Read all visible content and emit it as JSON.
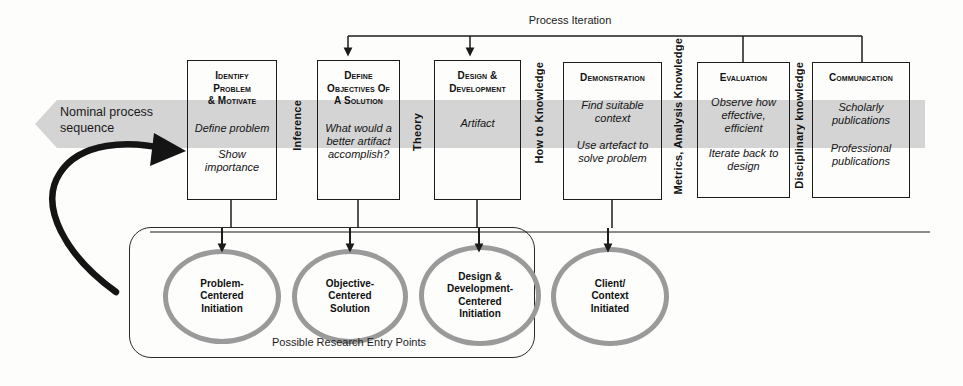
{
  "diagram": {
    "nominal_band_label": "Nominal process\nsequence",
    "process_iteration_label": "Process Iteration",
    "entry_points_caption": "Possible Research Entry Points",
    "accent_grey": "#d4d4d4",
    "circle_stroke": "#9a9a9a",
    "line_color": "#1b1b1b"
  },
  "boxes": [
    {
      "id": "identify-problem",
      "title": "Identify\nProblem\n& Motivate",
      "lines": [
        "Define problem",
        "Show\nimportance"
      ]
    },
    {
      "id": "define-objectives",
      "title": "Define\nObjectives of\na Solution",
      "lines": [
        "What would a\nbetter artifact\naccomplish?"
      ]
    },
    {
      "id": "design-development",
      "title": "Design &\nDevelopment",
      "lines": [
        "Artifact"
      ]
    },
    {
      "id": "demonstration",
      "title": "Demonstration",
      "lines": [
        "Find suitable\ncontext",
        "Use artefact to\nsolve problem"
      ]
    },
    {
      "id": "evaluation",
      "title": "Evaluation",
      "lines": [
        "Observe how\neffective,\nefficient",
        "Iterate back to\ndesign"
      ]
    },
    {
      "id": "communication",
      "title": "Communication",
      "lines": [
        "Scholarly\npublications",
        "Professional\npublications"
      ]
    }
  ],
  "knowledge_labels": [
    {
      "id": "inference",
      "text": "Inference"
    },
    {
      "id": "theory",
      "text": "Theory"
    },
    {
      "id": "how-to-knowledge",
      "text": "How to Knowledge"
    },
    {
      "id": "metrics-analysis-knowledge",
      "text": "Metrics, Analysis Knowledge"
    },
    {
      "id": "disciplinary-knowledge",
      "text": "Disciplinary knowledge"
    }
  ],
  "entry_points": [
    {
      "id": "problem-centered-initiation",
      "text": "Problem-\nCentered\nInitiation"
    },
    {
      "id": "objective-centered-solution",
      "text": "Objective-\nCentered\nSolution"
    },
    {
      "id": "design-development-centered-initiation",
      "text": "Design &\nDevelopment-\nCentered\nInitiation"
    },
    {
      "id": "client-context-initiated",
      "text": "Client/\nContext\nInitiated"
    }
  ]
}
